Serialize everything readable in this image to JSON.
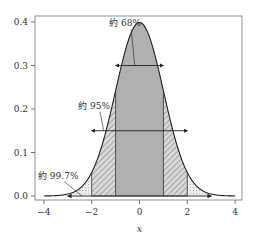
{
  "chart_data": {
    "type": "area",
    "title": "",
    "xlabel": "x",
    "ylabel": "",
    "xlim": [
      -4.3,
      4.3
    ],
    "ylim": [
      -0.01,
      0.41
    ],
    "x_ticks": [
      -4,
      -2,
      0,
      2,
      4
    ],
    "x_tick_labels": [
      "−4",
      "−2",
      "0",
      "2",
      "4"
    ],
    "y_ticks": [
      0.0,
      0.1,
      0.2,
      0.3,
      0.4
    ],
    "y_tick_labels": [
      "0.0",
      "0.1",
      "0.2",
      "0.3",
      "0.4"
    ],
    "grid": false,
    "legend": null,
    "series": [
      {
        "name": "standard normal pdf",
        "function": "exp(-x^2/2)/sqrt(2*pi)",
        "x_range": [
          -4,
          4
        ],
        "peak": 0.399
      }
    ],
    "regions": [
      {
        "name": "±1σ",
        "x_range": [
          -1,
          1
        ],
        "fill": "#b0b0b0",
        "hatch": "none",
        "label": "約 68%",
        "arrow_y": 0.3
      },
      {
        "name": "±2σ",
        "x_range": [
          -2,
          2
        ],
        "fill": "#d8d8d8",
        "hatch": "////",
        "label": "約 95%",
        "arrow_y": 0.15
      },
      {
        "name": "±3σ",
        "x_range": [
          -3,
          3
        ],
        "fill": "#ececec",
        "hatch": "....",
        "label": "約 99.7%",
        "arrow_y": 0.0
      }
    ],
    "annotations": [
      {
        "text": "約 68%",
        "x": -0.6,
        "y": 0.39,
        "points_to": [
          -0.2,
          0.3
        ]
      },
      {
        "text": "約 95%",
        "x": -1.9,
        "y": 0.2,
        "points_to": [
          -1.5,
          0.15
        ]
      },
      {
        "text": "約 99.7%",
        "x": -3.4,
        "y": 0.04,
        "points_to": [
          -2.4,
          0.0
        ]
      }
    ]
  }
}
